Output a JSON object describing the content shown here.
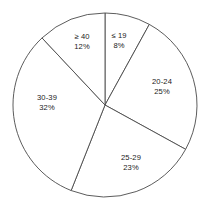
{
  "chart_data": {
    "type": "pie",
    "title": "",
    "subtitle": "",
    "xlabel": "",
    "ylabel": "",
    "grid": false,
    "legend": "none",
    "labels_inside": true,
    "start_angle_deg": 0,
    "direction": "clockwise",
    "categories": [
      "≤ 19",
      "20-24",
      "25-29",
      "30-39",
      "≥ 40"
    ],
    "values": [
      8,
      25,
      23,
      32,
      12
    ],
    "value_unit": "%",
    "slices": [
      {
        "id": "le-19",
        "category": "≤ 19",
        "value": 8,
        "value_label": "8%",
        "start_deg": 0.0,
        "end_deg": 28.8,
        "label_x": 119,
        "label_y": 41,
        "color": "#ffffff",
        "stroke": "#4a4a4a"
      },
      {
        "id": "20-24",
        "category": "20-24",
        "value": 25,
        "value_label": "25%",
        "start_deg": 28.8,
        "end_deg": 118.8,
        "label_x": 162,
        "label_y": 87,
        "color": "#ffffff",
        "stroke": "#4a4a4a"
      },
      {
        "id": "25-29",
        "category": "25-29",
        "value": 23,
        "value_label": "23%",
        "start_deg": 118.8,
        "end_deg": 201.6,
        "label_x": 131,
        "label_y": 163,
        "color": "#ffffff",
        "stroke": "#4a4a4a"
      },
      {
        "id": "30-39",
        "category": "30-39",
        "value": 32,
        "value_label": "32%",
        "start_deg": 201.6,
        "end_deg": 316.8,
        "label_x": 47,
        "label_y": 103,
        "color": "#ffffff",
        "stroke": "#4a4a4a"
      },
      {
        "id": "ge-40",
        "category": "≥ 40",
        "value": 12,
        "value_label": "12%",
        "start_deg": 316.8,
        "end_deg": 360.0,
        "label_x": 82,
        "label_y": 42,
        "color": "#ffffff",
        "stroke": "#4a4a4a"
      }
    ],
    "geometry": {
      "center_x": 105,
      "center_y": 105,
      "radius": 92
    },
    "colors": {
      "background": "#ffffff",
      "outline": "#4a4a4a",
      "text": "#1a1a1a"
    }
  }
}
